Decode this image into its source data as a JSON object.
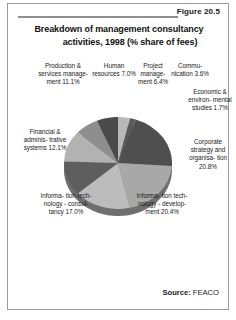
{
  "figure": {
    "number_label": "Figure 20.5",
    "title_line1": "Breakdown of management consultancy",
    "title_line2": "activities, 1998 (% share of fees)",
    "source_prefix": "Source:",
    "source_value": "FEACO"
  },
  "labels": {
    "production": "Production\n& services\nmanage-\nment\n11.1%",
    "human_resources": "Human\nresources\n7.0%",
    "project_management": "Project\nmanage-\nment\n6.4%",
    "communication": "Commu-\nnication\n3.6%",
    "economic": "Economic\n& environ-\nmental\nstudies\n1.7%",
    "financial": "Financial &\nadminis-\ntrative\nsystems\n12.1%",
    "corporate": "Corporate\nstrategy\nand\norganisa-\ntion\n20.8%",
    "it_consultancy": "Informa-\ntion tech-\nnology -\nconsul-\ntancy\n17.0%",
    "it_development": "Informa-\ntion tech-\nnology -\ndevelop-\nment\n20.4%"
  },
  "chart_data": {
    "type": "pie",
    "title": "Breakdown of management consultancy activities, 1998 (% share of fees)",
    "unit": "% share of fees",
    "source": "FEACO",
    "legend": "none",
    "start_angle_deg": 0,
    "direction": "clockwise",
    "three_d": true,
    "categories": [
      "Communication",
      "Economic & environmental studies",
      "Corporate strategy and organisation",
      "Information technology - development",
      "Information technology - consultancy",
      "Financial & administrative systems",
      "Production & services management",
      "Human resources",
      "Project management"
    ],
    "values": [
      3.6,
      1.7,
      20.8,
      20.4,
      17.0,
      12.1,
      11.1,
      7.0,
      6.4
    ],
    "colors": [
      "#b8b8b8",
      "#595959",
      "#4f4f4f",
      "#a8a8a8",
      "#bcbcbc",
      "#5e5e5e",
      "#b2b2b2",
      "#8e8e8e",
      "#4a4a4a"
    ]
  }
}
